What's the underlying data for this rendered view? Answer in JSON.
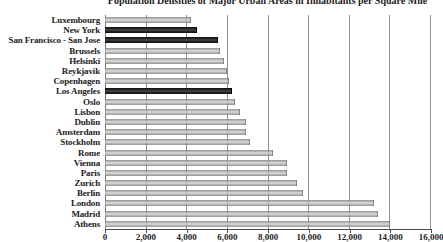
{
  "chart_data": {
    "type": "bar",
    "orientation": "horizontal",
    "title": "Population Densities of Major Urban Areas in Inhabitants per Square Mile",
    "categories": [
      "Luxembourg",
      "New York",
      "San Francisco - San Jose",
      "Brussels",
      "Helsinki",
      "Reykjavik",
      "Copenhagen",
      "Los Angeles",
      "Oslo",
      "Lisbon",
      "Dublin",
      "Amsterdam",
      "Stockholm",
      "Rome",
      "Vienna",
      "Paris",
      "Zurich",
      "Berlin",
      "London",
      "Madrid",
      "Athens"
    ],
    "values": [
      4200,
      4500,
      5500,
      5600,
      5800,
      5950,
      6050,
      6200,
      6350,
      6600,
      6900,
      6900,
      7100,
      8200,
      8900,
      8900,
      9400,
      9700,
      13200,
      13400,
      14000
    ],
    "bar_colors": [
      "gray",
      "black",
      "black",
      "gray",
      "gray",
      "gray",
      "gray",
      "black",
      "gray",
      "gray",
      "gray",
      "gray",
      "gray",
      "gray",
      "gray",
      "gray",
      "gray",
      "gray",
      "gray",
      "gray",
      "gray"
    ],
    "xlabel": "",
    "ylabel": "",
    "xlim": [
      0,
      16000
    ],
    "x_ticks": [
      "0",
      "2,000",
      "4,000",
      "6,000",
      "8,000",
      "10,000",
      "12,000",
      "14,000",
      "16,000"
    ],
    "grid": true,
    "legend": false
  },
  "colors": {
    "base_bar": "#a8a8a8",
    "highlight_bar": "#1c1c1c",
    "gridline": "#8f8f8f",
    "axis": "#4c4c4c",
    "text": "#1c1c1c",
    "background": "#ffffff"
  }
}
